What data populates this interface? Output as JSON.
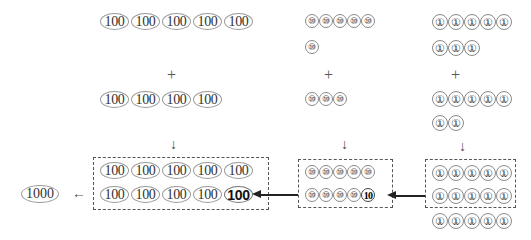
{
  "hundreds": {
    "addend1": [
      "100",
      "100",
      "100",
      "100",
      "100"
    ],
    "addend2": [
      "100",
      "100",
      "100",
      "100"
    ],
    "result_row1": [
      "100",
      "100",
      "100",
      "100",
      "100"
    ],
    "result_row2": [
      "100",
      "100",
      "100",
      "100"
    ],
    "carried": "100"
  },
  "tens": {
    "addend1_row1": [
      "⑩",
      "⑩",
      "⑩",
      "⑩",
      "⑩"
    ],
    "addend1_row2": [
      "⑩"
    ],
    "addend2": [
      "⑩",
      "⑩",
      "⑩"
    ],
    "result_row1": [
      "⑩",
      "⑩",
      "⑩",
      "⑩",
      "⑩"
    ],
    "result_row2": [
      "⑩",
      "⑩",
      "⑩",
      "⑩"
    ],
    "carried": "10"
  },
  "ones": {
    "addend1_row1": [
      "①",
      "①",
      "①",
      "①",
      "①"
    ],
    "addend1_row2": [
      "①",
      "①",
      "①"
    ],
    "addend2_row1": [
      "①",
      "①",
      "①",
      "①",
      "①"
    ],
    "addend2_row2": [
      "①",
      "①"
    ],
    "result_box_row1": [
      "①",
      "①",
      "①",
      "①",
      "①"
    ],
    "result_box_row2": [
      "①",
      "①",
      "①",
      "①",
      "①"
    ],
    "result_extra_row": [
      "①",
      "①",
      "①",
      "①",
      "①"
    ]
  },
  "thousand": {
    "label": "1000"
  },
  "symbols": {
    "plus": "+",
    "down_arrow": "↓",
    "left_arrow": "←"
  }
}
